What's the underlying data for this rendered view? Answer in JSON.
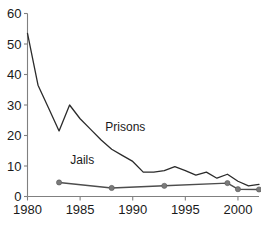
{
  "chart_data": {
    "type": "line",
    "title": "",
    "xlabel": "",
    "ylabel": "",
    "xlim": [
      1980,
      2002
    ],
    "ylim": [
      0,
      60
    ],
    "grid": false,
    "legend_position": "inline-annotation",
    "x_ticks": [
      "1980",
      "1985",
      "1990",
      "1995",
      "2000"
    ],
    "x_tick_values": [
      1980,
      1985,
      1990,
      1995,
      2000
    ],
    "y_ticks": [
      "0",
      "10",
      "20",
      "30",
      "40",
      "50",
      "60"
    ],
    "y_tick_values": [
      0,
      10,
      20,
      30,
      40,
      50,
      60
    ],
    "series": [
      {
        "name": "Prisons",
        "color": "#2b2b2b",
        "marker": "none",
        "x": [
          1980,
          1981,
          1982,
          1983,
          1984,
          1985,
          1986,
          1987,
          1988,
          1989,
          1990,
          1991,
          1992,
          1993,
          1994,
          1995,
          1996,
          1997,
          1998,
          1999,
          2000,
          2001,
          2002
        ],
        "values": [
          53.5,
          36.5,
          29.0,
          21.5,
          30.0,
          25.5,
          22.0,
          18.5,
          15.5,
          13.5,
          11.5,
          8.0,
          8.0,
          8.5,
          9.8,
          8.5,
          7.0,
          8.0,
          6.0,
          7.3,
          5.0,
          3.5,
          4.0
        ]
      },
      {
        "name": "Jails",
        "color": "#4d4d4d",
        "marker": "circle",
        "x": [
          1983,
          1988,
          1993,
          1999,
          2000,
          2002
        ],
        "values": [
          4.6,
          2.8,
          3.5,
          4.4,
          2.4,
          2.3
        ]
      }
    ],
    "annotations": [
      {
        "text": "Prisons",
        "x": 1989.3,
        "y": 21.5
      },
      {
        "text": "Jails",
        "x": 1985.2,
        "y": 10.5
      }
    ]
  }
}
